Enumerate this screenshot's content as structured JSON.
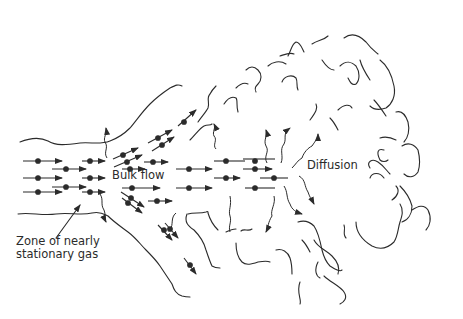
{
  "diagram": {
    "labels": {
      "bulk_flow": "Bulk flow",
      "diffusion": "Diffusion",
      "zone_line1": "Zone of nearly",
      "zone_line2": "stationary gas"
    },
    "colors": {
      "stroke": "#2b2b2b",
      "background": "#ffffff"
    },
    "regions": [
      "airway-channel",
      "bulk-flow-zone",
      "diffusion-zone",
      "alveolar-region"
    ]
  }
}
